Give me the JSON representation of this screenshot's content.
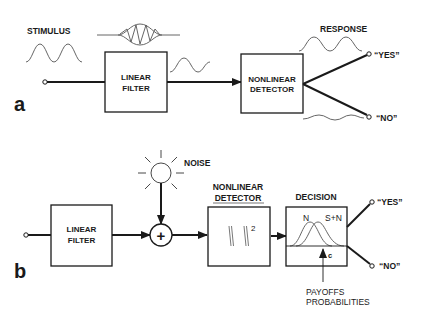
{
  "panel_a": {
    "label": "a",
    "stimulus_label": "STIMULUS",
    "linear_filter": {
      "line1": "LINEAR",
      "line2": "FILTER"
    },
    "nonlinear_detector": {
      "line1": "NONLINEAR",
      "line2": "DETECTOR"
    },
    "response_label": "RESPONSE",
    "outputs": {
      "yes": "“YES”",
      "no": "“NO”"
    }
  },
  "panel_b": {
    "label": "b",
    "noise_label": "NOISE",
    "adder_symbol": "+",
    "linear_filter": {
      "line1": "LINEAR",
      "line2": "FILTER"
    },
    "nonlinear_detector": {
      "line1": "NONLINEAR",
      "line2": "DETECTOR",
      "function": "| |",
      "exponent": "2"
    },
    "decision": {
      "title": "DECISION",
      "dist_noise": "N",
      "dist_signal_noise": "S+N",
      "criterion": "c"
    },
    "decision_inputs": {
      "line1": "PAYOFFS",
      "line2": "PROBABILITIES"
    },
    "outputs": {
      "yes": "“YES”",
      "no": "“NO”"
    }
  }
}
